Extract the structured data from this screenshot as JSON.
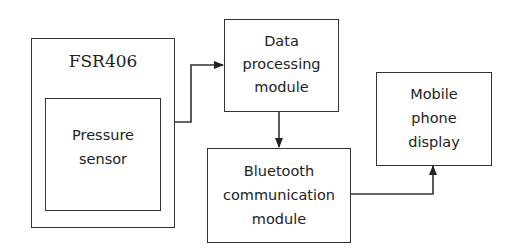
{
  "diagram": {
    "type": "block-diagram",
    "nodes": {
      "fsr": {
        "label": "FSR406"
      },
      "sensor": {
        "line1": "Pressure",
        "line2": "sensor"
      },
      "processing": {
        "line1": "Data",
        "line2": "processing",
        "line3": "module"
      },
      "bluetooth": {
        "line1": "Bluetooth",
        "line2": "communication",
        "line3": "module"
      },
      "mobile": {
        "line1": "Mobile",
        "line2": "phone",
        "line3": "display"
      }
    },
    "edges": [
      {
        "from": "FSR406",
        "to": "Data processing module"
      },
      {
        "from": "Data processing module",
        "to": "Bluetooth communication module"
      },
      {
        "from": "Bluetooth communication module",
        "to": "Mobile phone display"
      }
    ],
    "colors": {
      "stroke": "#333333",
      "text": "#222222",
      "background": "#ffffff"
    }
  }
}
